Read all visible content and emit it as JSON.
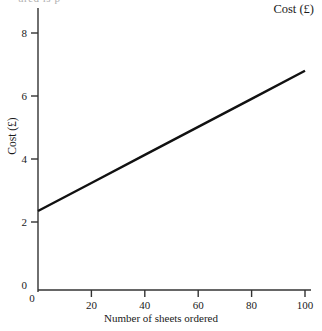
{
  "clipped_top_text": "ured is p",
  "chart_data": {
    "type": "line",
    "title": "Cost (£)",
    "xlabel": "Number of sheets ordered",
    "ylabel": "Cost (£)",
    "xlim": [
      0,
      100
    ],
    "ylim": [
      0,
      8.7
    ],
    "grid": false,
    "legend": "none",
    "x_ticks": [
      {
        "value": 0,
        "label": "0"
      },
      {
        "value": 20,
        "label": "20"
      },
      {
        "value": 40,
        "label": "40"
      },
      {
        "value": 60,
        "label": "60"
      },
      {
        "value": 80,
        "label": "80"
      },
      {
        "value": 100,
        "label": "100"
      }
    ],
    "y_ticks": [
      {
        "value": 0,
        "label": "0"
      },
      {
        "value": 2,
        "label": "2"
      },
      {
        "value": 4,
        "label": "4"
      },
      {
        "value": 6,
        "label": "6"
      },
      {
        "value": 8,
        "label": "8"
      }
    ],
    "series": [
      {
        "name": "Cost",
        "intercept": 2.35,
        "slope": 0.0445,
        "x": [
          0,
          20,
          40,
          60,
          80,
          100
        ],
        "values": [
          2.35,
          3.24,
          4.13,
          5.02,
          5.91,
          6.8
        ]
      }
    ],
    "line_color": "#111111",
    "axis_color": "#333333"
  }
}
